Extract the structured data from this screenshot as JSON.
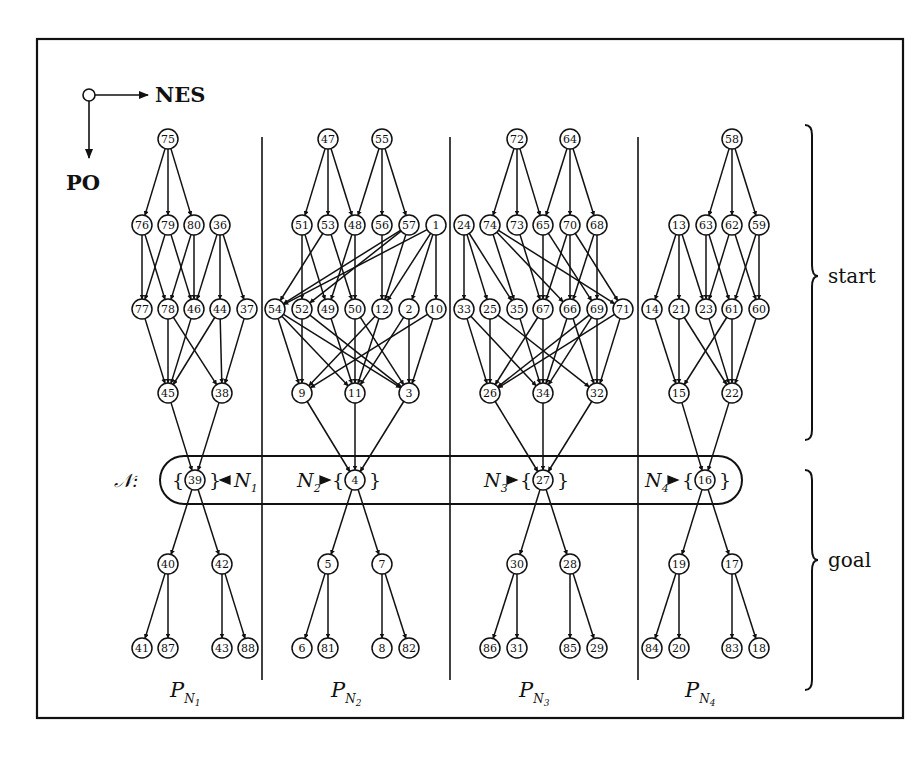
{
  "figure": {
    "legend": {
      "horizontal_label": "NES",
      "vertical_label": "PO"
    },
    "brackets": [
      {
        "label": "start",
        "y1": 123,
        "y2": 440
      },
      {
        "label": "goal",
        "y1": 468,
        "y2": 690
      }
    ],
    "goal_set": {
      "symbol": "𝒩",
      "colon": ":",
      "items": [
        {
          "name": "N",
          "sub": "1",
          "node": "39",
          "arrow": "left"
        },
        {
          "name": "N",
          "sub": "2",
          "node": "4",
          "arrow": "right"
        },
        {
          "name": "N",
          "sub": "3",
          "node": "27",
          "arrow": "right"
        },
        {
          "name": "N",
          "sub": "4",
          "node": "16",
          "arrow": "right"
        }
      ]
    },
    "partitions": [
      {
        "label": "P",
        "sub_name": "N",
        "sub_index": "1",
        "label_x": 185
      },
      {
        "label": "P",
        "sub_name": "N",
        "sub_index": "2",
        "label_x": 346
      },
      {
        "label": "P",
        "sub_name": "N",
        "sub_index": "3",
        "label_x": 534
      },
      {
        "label": "P",
        "sub_name": "N",
        "sub_index": "4",
        "label_x": 700
      }
    ],
    "dividers_x": [
      262,
      450,
      638
    ],
    "nodes": [
      {
        "id": "75",
        "x": 168,
        "y": 139
      },
      {
        "id": "76",
        "x": 142,
        "y": 225
      },
      {
        "id": "79",
        "x": 168,
        "y": 225
      },
      {
        "id": "80",
        "x": 194,
        "y": 225
      },
      {
        "id": "36",
        "x": 220,
        "y": 225
      },
      {
        "id": "77",
        "x": 142,
        "y": 309
      },
      {
        "id": "78",
        "x": 168,
        "y": 309
      },
      {
        "id": "46",
        "x": 194,
        "y": 309
      },
      {
        "id": "44",
        "x": 220,
        "y": 309
      },
      {
        "id": "37",
        "x": 247,
        "y": 309
      },
      {
        "id": "45",
        "x": 168,
        "y": 393
      },
      {
        "id": "38",
        "x": 222,
        "y": 393
      },
      {
        "id": "39",
        "x": 195,
        "y": 480
      },
      {
        "id": "40",
        "x": 168,
        "y": 564
      },
      {
        "id": "42",
        "x": 222,
        "y": 564
      },
      {
        "id": "41",
        "x": 142,
        "y": 648
      },
      {
        "id": "87",
        "x": 168,
        "y": 648
      },
      {
        "id": "43",
        "x": 222,
        "y": 648
      },
      {
        "id": "88",
        "x": 248,
        "y": 648
      },
      {
        "id": "47",
        "x": 328,
        "y": 139
      },
      {
        "id": "55",
        "x": 382,
        "y": 139
      },
      {
        "id": "51",
        "x": 302,
        "y": 225
      },
      {
        "id": "53",
        "x": 328,
        "y": 225
      },
      {
        "id": "48",
        "x": 355,
        "y": 225
      },
      {
        "id": "56",
        "x": 382,
        "y": 225
      },
      {
        "id": "57",
        "x": 409,
        "y": 225
      },
      {
        "id": "1",
        "x": 436,
        "y": 225
      },
      {
        "id": "54",
        "x": 275,
        "y": 309
      },
      {
        "id": "52",
        "x": 302,
        "y": 309
      },
      {
        "id": "49",
        "x": 328,
        "y": 309
      },
      {
        "id": "50",
        "x": 355,
        "y": 309
      },
      {
        "id": "12",
        "x": 382,
        "y": 309
      },
      {
        "id": "2",
        "x": 409,
        "y": 309
      },
      {
        "id": "10",
        "x": 436,
        "y": 309
      },
      {
        "id": "9",
        "x": 302,
        "y": 393
      },
      {
        "id": "11",
        "x": 355,
        "y": 393
      },
      {
        "id": "3",
        "x": 409,
        "y": 393
      },
      {
        "id": "4",
        "x": 355,
        "y": 480
      },
      {
        "id": "5",
        "x": 328,
        "y": 564
      },
      {
        "id": "7",
        "x": 382,
        "y": 564
      },
      {
        "id": "6",
        "x": 302,
        "y": 648
      },
      {
        "id": "81",
        "x": 328,
        "y": 648
      },
      {
        "id": "8",
        "x": 382,
        "y": 648
      },
      {
        "id": "82",
        "x": 409,
        "y": 648
      },
      {
        "id": "72",
        "x": 517,
        "y": 139
      },
      {
        "id": "64",
        "x": 570,
        "y": 139
      },
      {
        "id": "24",
        "x": 464,
        "y": 225
      },
      {
        "id": "74",
        "x": 490,
        "y": 225
      },
      {
        "id": "73",
        "x": 517,
        "y": 225
      },
      {
        "id": "65",
        "x": 543,
        "y": 225
      },
      {
        "id": "70",
        "x": 570,
        "y": 225
      },
      {
        "id": "68",
        "x": 597,
        "y": 225
      },
      {
        "id": "33",
        "x": 464,
        "y": 309
      },
      {
        "id": "25",
        "x": 490,
        "y": 309
      },
      {
        "id": "35",
        "x": 517,
        "y": 309
      },
      {
        "id": "67",
        "x": 543,
        "y": 309
      },
      {
        "id": "66",
        "x": 570,
        "y": 309
      },
      {
        "id": "69",
        "x": 597,
        "y": 309
      },
      {
        "id": "71",
        "x": 623,
        "y": 309
      },
      {
        "id": "26",
        "x": 490,
        "y": 393
      },
      {
        "id": "34",
        "x": 543,
        "y": 393
      },
      {
        "id": "32",
        "x": 597,
        "y": 393
      },
      {
        "id": "27",
        "x": 543,
        "y": 480
      },
      {
        "id": "30",
        "x": 517,
        "y": 564
      },
      {
        "id": "28",
        "x": 570,
        "y": 564
      },
      {
        "id": "86",
        "x": 490,
        "y": 648
      },
      {
        "id": "31",
        "x": 517,
        "y": 648
      },
      {
        "id": "85",
        "x": 570,
        "y": 648
      },
      {
        "id": "29",
        "x": 597,
        "y": 648
      },
      {
        "id": "58",
        "x": 732,
        "y": 139
      },
      {
        "id": "13",
        "x": 679,
        "y": 225
      },
      {
        "id": "63",
        "x": 706,
        "y": 225
      },
      {
        "id": "62",
        "x": 732,
        "y": 225
      },
      {
        "id": "59",
        "x": 759,
        "y": 225
      },
      {
        "id": "14",
        "x": 652,
        "y": 309
      },
      {
        "id": "21",
        "x": 679,
        "y": 309
      },
      {
        "id": "23",
        "x": 706,
        "y": 309
      },
      {
        "id": "61",
        "x": 732,
        "y": 309
      },
      {
        "id": "60",
        "x": 759,
        "y": 309
      },
      {
        "id": "15",
        "x": 679,
        "y": 393
      },
      {
        "id": "22",
        "x": 732,
        "y": 393
      },
      {
        "id": "16",
        "x": 705,
        "y": 480
      },
      {
        "id": "19",
        "x": 679,
        "y": 564
      },
      {
        "id": "17",
        "x": 732,
        "y": 564
      },
      {
        "id": "84",
        "x": 652,
        "y": 648
      },
      {
        "id": "20",
        "x": 679,
        "y": 648
      },
      {
        "id": "83",
        "x": 732,
        "y": 648
      },
      {
        "id": "18",
        "x": 759,
        "y": 648
      }
    ],
    "edges": [
      [
        "75",
        "76"
      ],
      [
        "75",
        "79"
      ],
      [
        "75",
        "80"
      ],
      [
        "76",
        "77"
      ],
      [
        "76",
        "78"
      ],
      [
        "79",
        "77"
      ],
      [
        "79",
        "46"
      ],
      [
        "80",
        "78"
      ],
      [
        "80",
        "46"
      ],
      [
        "36",
        "46"
      ],
      [
        "36",
        "44"
      ],
      [
        "36",
        "37"
      ],
      [
        "77",
        "45"
      ],
      [
        "78",
        "45"
      ],
      [
        "78",
        "38"
      ],
      [
        "46",
        "45"
      ],
      [
        "44",
        "45"
      ],
      [
        "44",
        "38"
      ],
      [
        "37",
        "38"
      ],
      [
        "45",
        "39"
      ],
      [
        "38",
        "39"
      ],
      [
        "39",
        "40"
      ],
      [
        "39",
        "42"
      ],
      [
        "40",
        "41"
      ],
      [
        "40",
        "87"
      ],
      [
        "42",
        "43"
      ],
      [
        "42",
        "88"
      ],
      [
        "47",
        "51"
      ],
      [
        "47",
        "53"
      ],
      [
        "47",
        "48"
      ],
      [
        "55",
        "48"
      ],
      [
        "55",
        "56"
      ],
      [
        "55",
        "57"
      ],
      [
        "51",
        "52"
      ],
      [
        "51",
        "49"
      ],
      [
        "53",
        "54"
      ],
      [
        "53",
        "50"
      ],
      [
        "48",
        "49"
      ],
      [
        "48",
        "50"
      ],
      [
        "56",
        "12"
      ],
      [
        "57",
        "54"
      ],
      [
        "57",
        "52"
      ],
      [
        "57",
        "12"
      ],
      [
        "1",
        "54"
      ],
      [
        "1",
        "12"
      ],
      [
        "1",
        "2"
      ],
      [
        "1",
        "10"
      ],
      [
        "54",
        "9"
      ],
      [
        "54",
        "11"
      ],
      [
        "54",
        "3"
      ],
      [
        "52",
        "9"
      ],
      [
        "52",
        "3"
      ],
      [
        "49",
        "11"
      ],
      [
        "50",
        "11"
      ],
      [
        "50",
        "3"
      ],
      [
        "12",
        "9"
      ],
      [
        "12",
        "11"
      ],
      [
        "2",
        "11"
      ],
      [
        "2",
        "3"
      ],
      [
        "10",
        "9"
      ],
      [
        "10",
        "3"
      ],
      [
        "9",
        "4"
      ],
      [
        "11",
        "4"
      ],
      [
        "3",
        "4"
      ],
      [
        "4",
        "5"
      ],
      [
        "4",
        "7"
      ],
      [
        "5",
        "6"
      ],
      [
        "5",
        "81"
      ],
      [
        "7",
        "8"
      ],
      [
        "7",
        "82"
      ],
      [
        "72",
        "74"
      ],
      [
        "72",
        "73"
      ],
      [
        "72",
        "65"
      ],
      [
        "64",
        "65"
      ],
      [
        "64",
        "70"
      ],
      [
        "64",
        "68"
      ],
      [
        "24",
        "33"
      ],
      [
        "24",
        "25"
      ],
      [
        "24",
        "35"
      ],
      [
        "74",
        "35"
      ],
      [
        "74",
        "66"
      ],
      [
        "74",
        "71"
      ],
      [
        "73",
        "67"
      ],
      [
        "65",
        "67"
      ],
      [
        "65",
        "69"
      ],
      [
        "70",
        "66"
      ],
      [
        "70",
        "67"
      ],
      [
        "70",
        "71"
      ],
      [
        "68",
        "66"
      ],
      [
        "68",
        "69"
      ],
      [
        "33",
        "26"
      ],
      [
        "33",
        "34"
      ],
      [
        "25",
        "26"
      ],
      [
        "25",
        "32"
      ],
      [
        "35",
        "34"
      ],
      [
        "67",
        "26"
      ],
      [
        "67",
        "34"
      ],
      [
        "66",
        "34"
      ],
      [
        "66",
        "32"
      ],
      [
        "69",
        "26"
      ],
      [
        "69",
        "34"
      ],
      [
        "69",
        "32"
      ],
      [
        "71",
        "26"
      ],
      [
        "71",
        "32"
      ],
      [
        "26",
        "27"
      ],
      [
        "34",
        "27"
      ],
      [
        "32",
        "27"
      ],
      [
        "27",
        "30"
      ],
      [
        "27",
        "28"
      ],
      [
        "30",
        "86"
      ],
      [
        "30",
        "31"
      ],
      [
        "28",
        "85"
      ],
      [
        "28",
        "29"
      ],
      [
        "58",
        "63"
      ],
      [
        "58",
        "62"
      ],
      [
        "58",
        "59"
      ],
      [
        "13",
        "14"
      ],
      [
        "13",
        "21"
      ],
      [
        "13",
        "23"
      ],
      [
        "63",
        "23"
      ],
      [
        "63",
        "61"
      ],
      [
        "62",
        "23"
      ],
      [
        "62",
        "60"
      ],
      [
        "59",
        "61"
      ],
      [
        "59",
        "60"
      ],
      [
        "14",
        "15"
      ],
      [
        "21",
        "15"
      ],
      [
        "21",
        "22"
      ],
      [
        "23",
        "22"
      ],
      [
        "61",
        "15"
      ],
      [
        "61",
        "22"
      ],
      [
        "60",
        "22"
      ],
      [
        "15",
        "16"
      ],
      [
        "22",
        "16"
      ],
      [
        "16",
        "19"
      ],
      [
        "16",
        "17"
      ],
      [
        "19",
        "84"
      ],
      [
        "19",
        "20"
      ],
      [
        "17",
        "83"
      ],
      [
        "17",
        "18"
      ]
    ]
  }
}
